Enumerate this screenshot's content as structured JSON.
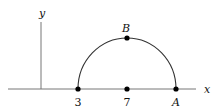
{
  "diagram": {
    "axes": {
      "x_label": "x",
      "y_label": "y"
    },
    "points": [
      {
        "id": "left",
        "label": "3",
        "x_value": 3
      },
      {
        "id": "center",
        "label": "7",
        "x_value": 7
      },
      {
        "id": "A",
        "label": "A"
      },
      {
        "id": "B",
        "label": "B"
      }
    ],
    "curve": "semicircle centered at 7 from 3 to A, top point B",
    "colors": {
      "stroke": "#333333",
      "point": "#000000",
      "axis": "#777777"
    }
  }
}
